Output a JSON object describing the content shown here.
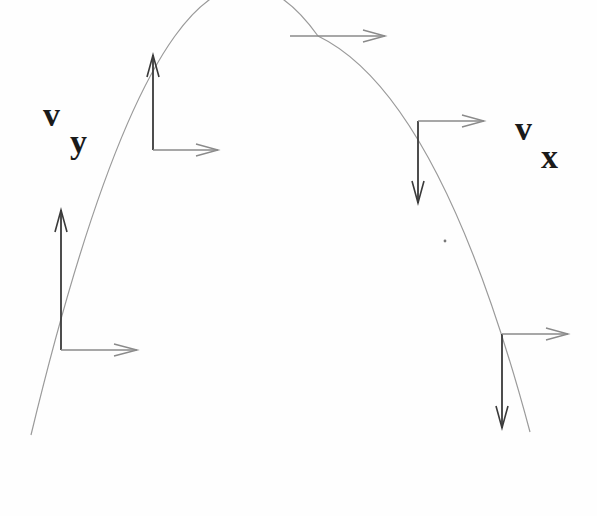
{
  "figure": {
    "background_color": "#fefefe",
    "trajectory_color": "#9a9a9a",
    "vertical_arrow_color": "#3a3a3a",
    "horizontal_arrow_color": "#8a8a8a"
  },
  "labels": {
    "vy": {
      "main": "v",
      "sub": "y"
    },
    "vx": {
      "main": "v",
      "sub": "x"
    }
  },
  "trajectory": {
    "shape": "parabola",
    "start": [
      31,
      435
    ],
    "apex": [
      318,
      36
    ],
    "end": [
      530,
      432
    ]
  },
  "velocity_points": [
    {
      "name": "launch-point",
      "origin": [
        61,
        350
      ],
      "vy_tip": [
        61,
        210
      ],
      "vx_tip": [
        137,
        350
      ],
      "vy_direction": "up"
    },
    {
      "name": "rising-point",
      "origin": [
        153,
        150
      ],
      "vy_tip": [
        153,
        55
      ],
      "vx_tip": [
        218,
        150
      ],
      "vy_direction": "up"
    },
    {
      "name": "apex-point",
      "origin": [
        290,
        36
      ],
      "vy_tip": null,
      "vx_tip": [
        385,
        36
      ],
      "vy_direction": "none"
    },
    {
      "name": "falling-point",
      "origin": [
        418,
        121
      ],
      "vy_tip": [
        418,
        203
      ],
      "vx_tip": [
        484,
        121
      ],
      "vy_direction": "down"
    },
    {
      "name": "landing-point",
      "origin": [
        502,
        334
      ],
      "vy_tip": [
        502,
        428
      ],
      "vx_tip": [
        568,
        334
      ],
      "vy_direction": "down"
    }
  ]
}
